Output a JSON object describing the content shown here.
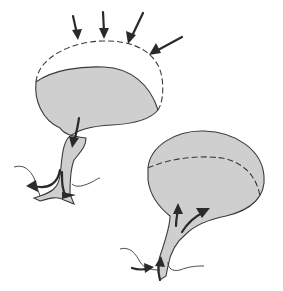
{
  "diagram": {
    "colors": {
      "fill": "#cfcfcf",
      "stroke": "#3a3a3a",
      "arrow": "#2a2a2a",
      "background": "#ffffff"
    },
    "panels": [
      {
        "id": "compressed",
        "position": "top-left",
        "outline": "dashed original volume above shaded reduced volume",
        "arrows": {
          "compression_arrows": 4,
          "compression_direction": "inward from above",
          "flow_direction": "outward down through duct",
          "outflow_arrows": 3
        }
      },
      {
        "id": "filled",
        "position": "bottom-right",
        "outline": "solid shaded full volume with dashed internal line",
        "arrows": {
          "flow_direction": "inward up through duct",
          "inflow_arrows": 4
        }
      }
    ]
  }
}
